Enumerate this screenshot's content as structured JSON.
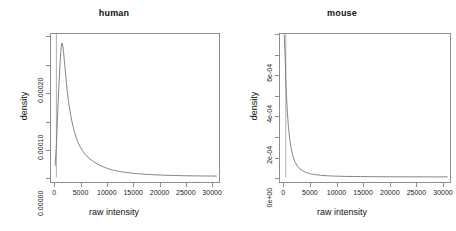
{
  "figure": {
    "background": "#ffffff",
    "axis_color": "#8d8d8d",
    "curve_color": "#777777",
    "rug_color": "#b8b8b8",
    "text_color": "#1a1a1a"
  },
  "chart_data": [
    {
      "type": "line",
      "title": "human",
      "xlabel": "raw intensity",
      "ylabel": "density",
      "xlim": [
        -800,
        31500
      ],
      "ylim": [
        -8.5e-06,
        0.000256
      ],
      "grid": false,
      "legend": "none",
      "xticks": [
        0,
        5000,
        10000,
        15000,
        20000,
        25000,
        30000
      ],
      "xticklabels": [
        "0",
        "5000",
        "10000",
        "15000",
        "20000",
        "25000",
        "30000"
      ],
      "yticks": [
        0.0,
        0.0001,
        0.0002
      ],
      "yticklabels": [
        "0.00000",
        "0.00010",
        "0.00020"
      ],
      "yminorticks": [
        5e-05,
        0.00015,
        0.00025
      ],
      "series": [
        {
          "name": "human density",
          "x": [
            0,
            250,
            500,
            750,
            1000,
            1150,
            1300,
            1450,
            1600,
            1800,
            2000,
            2300,
            2600,
            3000,
            3400,
            3800,
            4300,
            4800,
            5400,
            6000,
            6700,
            7400,
            8200,
            9000,
            10000,
            11000,
            12000,
            13000,
            14000,
            15000,
            16000,
            17000,
            18000,
            19000,
            20000,
            21500,
            23000,
            25000,
            27000,
            29000,
            31000
          ],
          "y": [
            2.1e-05,
            6e-05,
            0.000118,
            0.00017,
            0.000213,
            0.000231,
            0.00024,
            0.000236,
            0.000225,
            0.000205,
            0.000185,
            0.000156,
            0.000133,
            0.00011,
            9.2e-05,
            7.8e-05,
            6.45e-05,
            5.45e-05,
            4.55e-05,
            3.85e-05,
            3.25e-05,
            2.78e-05,
            2.32e-05,
            1.96e-05,
            1.58e-05,
            1.3e-05,
            1.1e-05,
            9.4e-06,
            8.1e-06,
            7e-06,
            6.2e-06,
            5.5e-06,
            4.9e-06,
            4.4e-06,
            4e-06,
            3.5e-06,
            3.1e-06,
            2.7e-06,
            2.4e-06,
            2.2e-06,
            2.1e-06
          ]
        }
      ],
      "rug_line_x": 250,
      "rug_line_ytop": 0.000256
    },
    {
      "type": "line",
      "title": "mouse",
      "xlabel": "raw intensity",
      "ylabel": "density",
      "xlim": [
        -800,
        31500
      ],
      "ylim": [
        -2.35e-05,
        0.000705
      ],
      "grid": false,
      "legend": "none",
      "xticks": [
        0,
        5000,
        10000,
        15000,
        20000,
        25000,
        30000
      ],
      "xticklabels": [
        "0",
        "5000",
        "10000",
        "15000",
        "20000",
        "25000",
        "30000"
      ],
      "yticks": [
        0.0,
        0.0002,
        0.0004,
        0.0006
      ],
      "yticklabels": [
        "0e+00",
        "2e-04",
        "4e-04",
        "6e-04"
      ],
      "yminorticks": [
        0.0001,
        0.0003,
        0.0005,
        0.0007
      ],
      "series": [
        {
          "name": "mouse density",
          "x": [
            0,
            150,
            300,
            450,
            600,
            800,
            1000,
            1250,
            1500,
            1800,
            2100,
            2500,
            2900,
            3400,
            3900,
            4500,
            5200,
            6000,
            6900,
            7900,
            9000,
            10200,
            11500,
            13000,
            14500,
            16000,
            18000,
            20000,
            22500,
            25000,
            28000,
            31000
          ],
          "y": [
            0.0007,
            0.00061,
            0.00048,
            0.00039,
            0.00032,
            0.00025,
            0.000198,
            0.000152,
            0.00012,
            9.2e-05,
            7.25e-05,
            5.5e-05,
            4.3e-05,
            3.3e-05,
            2.62e-05,
            2.05e-05,
            1.58e-05,
            1.22e-05,
            9.6e-06,
            7.6e-06,
            6.1e-06,
            5e-06,
            4.2e-06,
            3.6e-06,
            3.1e-06,
            2.8e-06,
            2.5e-06,
            2.2e-06,
            2e-06,
            1.8e-06,
            1.7e-06,
            1.6e-06
          ]
        }
      ],
      "rug_line_x": 300,
      "rug_line_ytop": 0.000705
    }
  ]
}
